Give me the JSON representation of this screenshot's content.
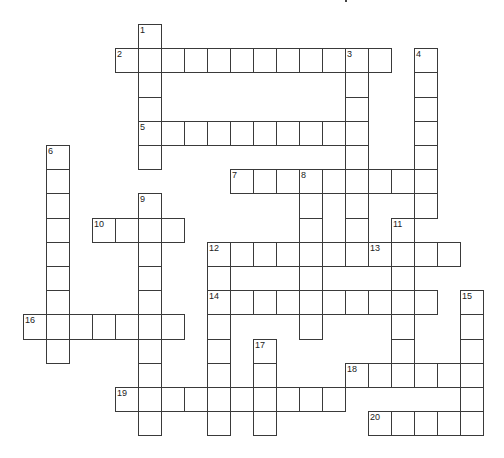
{
  "puzzle": {
    "title_fragment": "",
    "grid_geometry": {
      "origin_x": 23,
      "origin_y": 24,
      "cell_width": 23,
      "cell_height": 24.2,
      "columns": 20,
      "rows": 17
    },
    "colors": {
      "border": "#3a3a3a",
      "cell_background": "#ffffff",
      "number_text": "#222222",
      "page_background": "#ffffff"
    },
    "words": [
      {
        "number": 1,
        "direction": "down",
        "row": 0,
        "col": 5,
        "length": 6
      },
      {
        "number": 2,
        "direction": "across",
        "row": 1,
        "col": 4,
        "length": 12
      },
      {
        "number": 3,
        "direction": "down",
        "row": 1,
        "col": 14,
        "length": 9
      },
      {
        "number": 4,
        "direction": "down",
        "row": 1,
        "col": 17,
        "length": 7
      },
      {
        "number": 5,
        "direction": "across",
        "row": 4,
        "col": 5,
        "length": 10
      },
      {
        "number": 6,
        "direction": "down",
        "row": 5,
        "col": 1,
        "length": 9
      },
      {
        "number": 7,
        "direction": "across",
        "row": 6,
        "col": 9,
        "length": 9
      },
      {
        "number": 8,
        "direction": "down",
        "row": 6,
        "col": 12,
        "length": 7
      },
      {
        "number": 9,
        "direction": "down",
        "row": 7,
        "col": 5,
        "length": 10
      },
      {
        "number": 10,
        "direction": "across",
        "row": 8,
        "col": 3,
        "length": 4
      },
      {
        "number": 11,
        "direction": "down",
        "row": 8,
        "col": 16,
        "length": 7
      },
      {
        "number": 12,
        "direction": "across",
        "row": 9,
        "col": 8,
        "length": 6
      },
      {
        "number": 12,
        "direction": "down",
        "row": 9,
        "col": 8,
        "length": 8
      },
      {
        "number": 13,
        "direction": "across",
        "row": 9,
        "col": 15,
        "length": 4
      },
      {
        "number": 14,
        "direction": "across",
        "row": 11,
        "col": 8,
        "length": 10
      },
      {
        "number": 15,
        "direction": "down",
        "row": 11,
        "col": 19,
        "length": 6
      },
      {
        "number": 16,
        "direction": "across",
        "row": 12,
        "col": 0,
        "length": 7
      },
      {
        "number": 17,
        "direction": "down",
        "row": 13,
        "col": 10,
        "length": 4
      },
      {
        "number": 18,
        "direction": "across",
        "row": 14,
        "col": 14,
        "length": 6
      },
      {
        "number": 19,
        "direction": "across",
        "row": 15,
        "col": 4,
        "length": 10
      },
      {
        "number": 20,
        "direction": "across",
        "row": 16,
        "col": 15,
        "length": 5
      }
    ]
  }
}
